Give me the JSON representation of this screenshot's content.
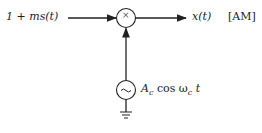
{
  "diagram": {
    "input_label": "1 + ms(t)",
    "multiplier_symbol": "×",
    "output_label": "x(t)",
    "output_tag": "[AM]",
    "oscillator_symbol": "~",
    "carrier_label": "A",
    "carrier_sub": "c",
    "carrier_func": "cos ω",
    "carrier_sub2": "c",
    "carrier_var": "t"
  },
  "colors": {
    "line": "#222222",
    "background": "#ffffff"
  }
}
